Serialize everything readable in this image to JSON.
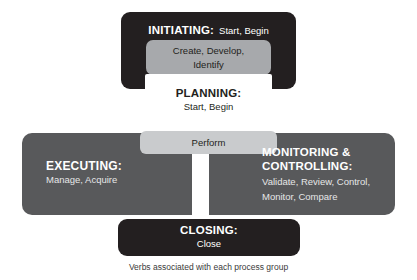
{
  "diagram": {
    "caption": "Verbs associated with each process group",
    "colors": {
      "dark": "#231f20",
      "band_gray": "#58595b",
      "mid_gray": "#a7a9ac",
      "light_gray": "#c9cbcd",
      "white": "#ffffff"
    },
    "groups": [
      {
        "id": "initiating",
        "title": "INITIATING:",
        "verbs": "Start, Begin"
      },
      {
        "id": "create-develop",
        "verbs_line1": "Create, Develop,",
        "verbs_line2": "Identify"
      },
      {
        "id": "planning",
        "title": "PLANNING:",
        "verbs": "Start, Begin"
      },
      {
        "id": "perform",
        "verbs": "Perform"
      },
      {
        "id": "executing",
        "title": "EXECUTING:",
        "verbs": "Manage, Acquire"
      },
      {
        "id": "monitoring",
        "title_line1": "MONITORING &",
        "title_line2": "CONTROLLING:",
        "verbs_line1": "Validate, Review, Control,",
        "verbs_line2": "Monitor, Compare"
      },
      {
        "id": "closing",
        "title": "CLOSING:",
        "verbs": "Close"
      }
    ]
  }
}
